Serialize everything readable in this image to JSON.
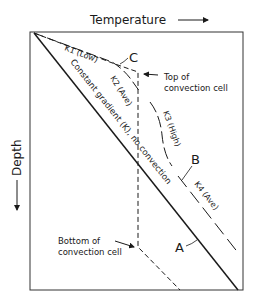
{
  "diagram": {
    "x_axis_label": "Temperature",
    "y_axis_label": "Depth",
    "lines": [
      {
        "id": "A",
        "label": "A",
        "style": "solid",
        "description": "Constant gradient (K), no convection"
      },
      {
        "id": "B",
        "label": "B",
        "style": "long-dash",
        "segments": [
          "K1 (Low)",
          "K2 (Ave)",
          "K3 (High)",
          "K4 (Ave)"
        ]
      },
      {
        "id": "C",
        "label": "C",
        "style": "dashed",
        "description": "Convection cell profile"
      }
    ],
    "annotations": {
      "line_a_text": "Constant gradient (K), no convection",
      "k1": "K1 (Low)",
      "k2": "K2 (Ave)",
      "k3": "K3 (High)",
      "k4": "K4 (Ave)",
      "top_cell_line1": "Top of",
      "top_cell_line2": "convection cell",
      "bottom_cell_line1": "Bottom of",
      "bottom_cell_line2": "convection cell",
      "label_a": "A",
      "label_b": "B",
      "label_c": "C"
    }
  }
}
